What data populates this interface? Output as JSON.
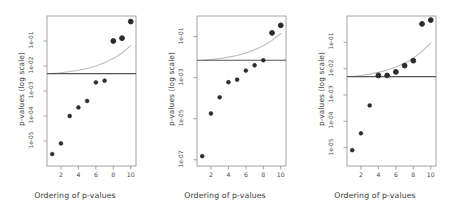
{
  "figure": {
    "panel_count": 3,
    "background_color": "#ffffff",
    "point_color": "#2b2b2b",
    "threshold_line_color": "#555555",
    "curve_color": "#bdbdbd",
    "frame_color": "#9a9a9a"
  },
  "chart_data": [
    {
      "type": "scatter",
      "title": "",
      "xlabel": "Ordering of p-values",
      "ylabel": "p-values (log scale)",
      "x": [
        1,
        2,
        3,
        4,
        5,
        6,
        7,
        8,
        9,
        10
      ],
      "values": [
        3e-06,
        8e-06,
        0.0001,
        0.00022,
        0.0004,
        0.0022,
        0.0026,
        0.1,
        0.13,
        0.6
      ],
      "ytick_labels": [
        "1e-05",
        "1e-04",
        "1e-03",
        "1e-02",
        "1e-01"
      ],
      "ytick_values": [
        1e-05,
        0.0001,
        0.001,
        0.01,
        0.1
      ],
      "xtick_labels": [
        "2",
        "4",
        "6",
        "8",
        "10"
      ],
      "xtick_values": [
        2,
        4,
        6,
        8,
        10
      ],
      "ylim": [
        1e-06,
        1.0
      ],
      "xlim": [
        0.4,
        10.6
      ],
      "grid": false,
      "legend": "none",
      "threshold_line": {
        "name": "bonferroni-threshold",
        "y": 0.005
      },
      "critical_curve": {
        "name": "bh-critical-values",
        "x": [
          1,
          2,
          3,
          4,
          5,
          6,
          7,
          8,
          9,
          10
        ],
        "y": [
          0.005,
          0.0054,
          0.006,
          0.0068,
          0.008,
          0.01,
          0.0135,
          0.02,
          0.033,
          0.065
        ]
      }
    },
    {
      "type": "scatter",
      "title": "",
      "xlabel": "Ordering of p-values",
      "ylabel": "p-values (log scale)",
      "x": [
        1,
        2,
        3,
        4,
        5,
        6,
        7,
        8,
        9,
        10
      ],
      "values": [
        1.5e-07,
        1.8e-05,
        0.00011,
        0.0006,
        0.0008,
        0.0022,
        0.004,
        0.007,
        0.15,
        0.35
      ],
      "ytick_labels": [
        "1e-07",
        "1e-05",
        "1e-03",
        "1e-01"
      ],
      "ytick_values": [
        1e-07,
        1e-05,
        0.001,
        0.1
      ],
      "xtick_labels": [
        "2",
        "4",
        "6",
        "8",
        "10"
      ],
      "xtick_values": [
        2,
        4,
        6,
        8,
        10
      ],
      "ylim": [
        5e-08,
        1.0
      ],
      "xlim": [
        0.4,
        10.6
      ],
      "grid": false,
      "legend": "none",
      "threshold_line": {
        "name": "bonferroni-threshold",
        "y": 0.007
      },
      "critical_curve": {
        "name": "bh-critical-values",
        "x": [
          1,
          2,
          3,
          4,
          5,
          6,
          7,
          8,
          9,
          10
        ],
        "y": [
          0.007,
          0.0076,
          0.0085,
          0.01,
          0.012,
          0.016,
          0.023,
          0.036,
          0.065,
          0.14
        ]
      }
    },
    {
      "type": "scatter",
      "title": "",
      "xlabel": "Ordering of p-values",
      "ylabel": "p-values (log scale)",
      "x": [
        1,
        2,
        3,
        4,
        5,
        6,
        7,
        8,
        9,
        10
      ],
      "values": [
        8e-06,
        3.5e-05,
        0.0004,
        0.0055,
        0.0055,
        0.0075,
        0.013,
        0.02,
        0.5,
        0.7
      ],
      "ytick_labels": [
        "1e-05",
        "1e-04",
        "1e-03",
        "1e-02",
        "1e-01"
      ],
      "ytick_values": [
        1e-05,
        0.0001,
        0.001,
        0.01,
        0.1
      ],
      "xtick_labels": [
        "2",
        "4",
        "6",
        "8",
        "10"
      ],
      "xtick_values": [
        2,
        4,
        6,
        8,
        10
      ],
      "ylim": [
        2e-06,
        1.0
      ],
      "xlim": [
        0.4,
        10.6
      ],
      "grid": false,
      "legend": "none",
      "threshold_line": {
        "name": "bonferroni-threshold",
        "y": 0.005
      },
      "critical_curve": {
        "name": "bh-critical-values",
        "x": [
          1,
          2,
          3,
          4,
          5,
          6,
          7,
          8,
          9,
          10
        ],
        "y": [
          0.005,
          0.0055,
          0.0062,
          0.0072,
          0.0088,
          0.0115,
          0.016,
          0.025,
          0.045,
          0.095
        ]
      }
    }
  ]
}
